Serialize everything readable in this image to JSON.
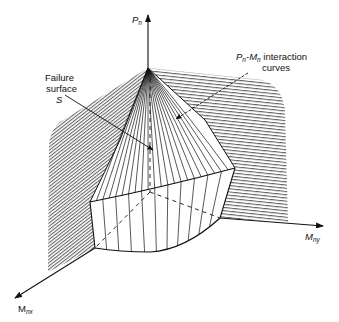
{
  "figure": {
    "axes": {
      "vertical": {
        "symbol": "P",
        "subscript": "n"
      },
      "horizontal_left": {
        "symbol": "M",
        "subscript": "nx"
      },
      "horizontal_right": {
        "symbol": "M",
        "subscript": "ny"
      }
    },
    "annotations": {
      "failure_surface": {
        "line1": "Failure",
        "line2": "surface",
        "line3": "S"
      },
      "interaction_curves": {
        "p_symbol": "P",
        "p_sub": "n",
        "dash": "-",
        "m_symbol": "M",
        "m_sub": "n",
        "line1_rest": " interaction",
        "line2": "curves"
      }
    },
    "colors": {
      "ink": "#111111",
      "background": "#ffffff"
    }
  }
}
